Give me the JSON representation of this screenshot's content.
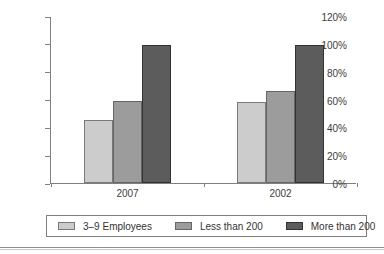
{
  "chart_data": {
    "type": "bar",
    "title": "",
    "categories": [
      "2007",
      "2002"
    ],
    "series": [
      {
        "name": "3–9 Employees",
        "values": [
          45,
          58
        ],
        "fill": "#cccccc",
        "border": "#7a7a7a"
      },
      {
        "name": "Less than 200",
        "values": [
          59,
          66
        ],
        "fill": "#9c9c9c",
        "border": "#666666"
      },
      {
        "name": "More than 200",
        "values": [
          99,
          99
        ],
        "fill": "#5c5c5c",
        "border": "#333333"
      }
    ],
    "xlabel": "",
    "ylabel": "",
    "ylim": [
      0,
      120
    ],
    "ytick_step": 20,
    "ytick_labels": [
      "0%",
      "20%",
      "40%",
      "60%",
      "80%",
      "100%",
      "120%"
    ],
    "grid": false,
    "legend_position": "bottom",
    "axis_color": "#7f7f7f",
    "text_color": "#3d3d3d",
    "background_color": "#ffffff"
  }
}
